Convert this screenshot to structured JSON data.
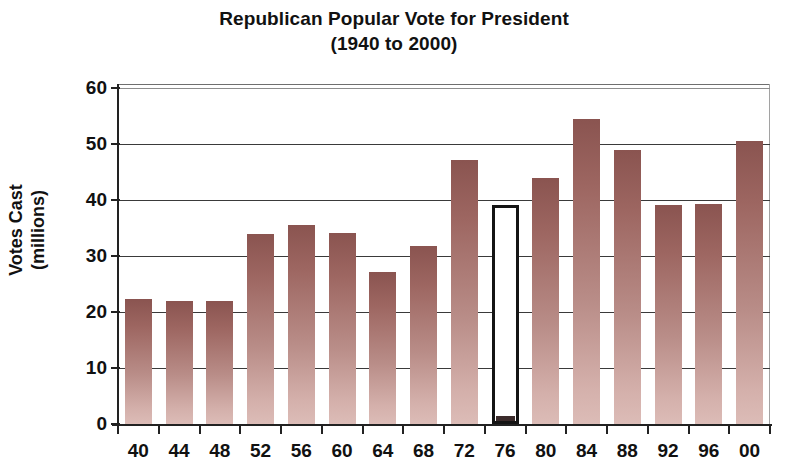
{
  "chart_data": {
    "type": "bar",
    "title": "Republican Popular Vote for President",
    "subtitle": "(1940 to 2000)",
    "xlabel": "",
    "ylabel": "Votes Cast\n(millions)",
    "categories": [
      "40",
      "44",
      "48",
      "52",
      "56",
      "60",
      "64",
      "68",
      "72",
      "76",
      "80",
      "84",
      "88",
      "92",
      "96",
      "00"
    ],
    "values": [
      22.3,
      22.0,
      22.0,
      34.0,
      35.6,
      34.1,
      27.2,
      31.8,
      47.2,
      39.1,
      43.9,
      54.5,
      48.9,
      39.1,
      39.2,
      50.5
    ],
    "highlight_index": 9,
    "highlight_style": "outlined-empty",
    "ylim": [
      0,
      60
    ],
    "yticks": [
      0,
      10,
      20,
      30,
      40,
      50,
      60
    ],
    "ytick_labels": [
      "0",
      "10",
      "20",
      "30",
      "40",
      "50",
      "60"
    ],
    "grid": "horizontal",
    "legend": "none",
    "bar_color_top": "#8a5450",
    "bar_color_bottom": "#dcbcb7"
  }
}
